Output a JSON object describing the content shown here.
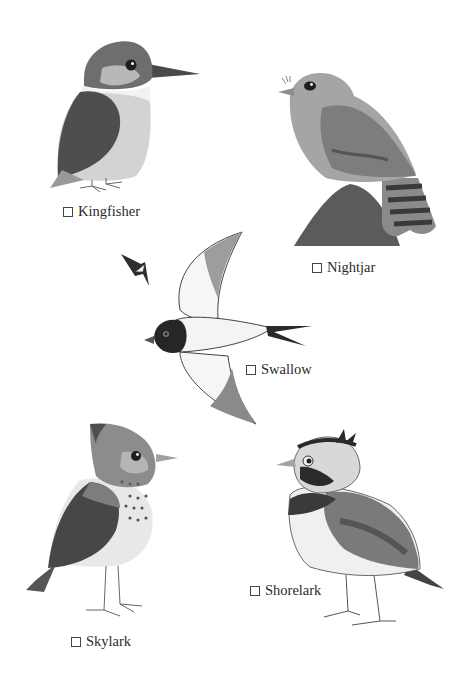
{
  "page": {
    "type": "bird-checklist-illustration",
    "style": "grayscale watercolor"
  },
  "birds": [
    {
      "id": "kingfisher",
      "label": "Kingfisher",
      "checked": false
    },
    {
      "id": "nightjar",
      "label": "Nightjar",
      "checked": false
    },
    {
      "id": "swallow",
      "label": "Swallow",
      "checked": false
    },
    {
      "id": "skylark",
      "label": "Skylark",
      "checked": false
    },
    {
      "id": "shorelark",
      "label": "Shorelark",
      "checked": false
    }
  ],
  "colors": {
    "background": "#ffffff",
    "ink": "#2b2b2b",
    "dark": "#3a3a3a",
    "mid": "#7a7a7a",
    "light": "#bdbdbd",
    "pale": "#e2e2e2"
  }
}
